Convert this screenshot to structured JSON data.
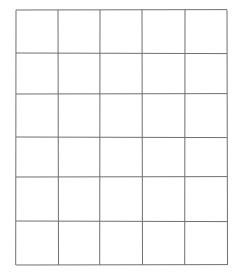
{
  "grid": {
    "rows": 6,
    "columns": 5,
    "line_color": "#6f6f6f",
    "background": "#ffffff",
    "x_lines": [
      16,
      58,
      100,
      142,
      185,
      227
    ],
    "y_lines": [
      10,
      53,
      94,
      137,
      177,
      221,
      265
    ]
  }
}
